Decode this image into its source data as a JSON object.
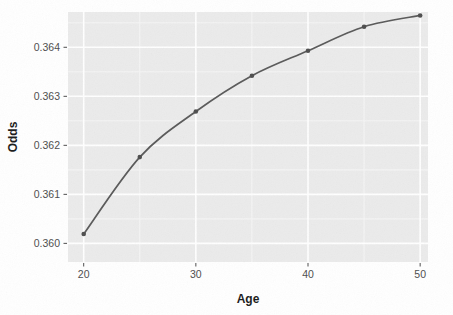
{
  "chart_data": {
    "type": "line",
    "title": "",
    "subtitle": "",
    "xlabel": "Age",
    "ylabel": "Odds",
    "x": [
      20,
      25,
      30,
      35,
      40,
      45,
      50
    ],
    "values": [
      0.36019,
      0.36176,
      0.36269,
      0.36342,
      0.36393,
      0.36442,
      0.36465
    ],
    "series": [
      {
        "name": "Odds",
        "x": [
          20,
          25,
          30,
          35,
          40,
          45,
          50
        ],
        "values": [
          0.36019,
          0.36176,
          0.36269,
          0.36342,
          0.36393,
          0.36442,
          0.36465
        ]
      }
    ],
    "xlim": [
      18.6,
      50.7
    ],
    "ylim": [
      0.35962,
      0.36472
    ],
    "x_ticks": [
      20,
      30,
      40,
      50
    ],
    "x_tick_labels": [
      "20",
      "30",
      "40",
      "50"
    ],
    "y_ticks": [
      0.36,
      0.361,
      0.362,
      0.363,
      0.364
    ],
    "y_tick_labels": [
      "0.360",
      "0.361",
      "0.362",
      "0.363",
      "0.364"
    ],
    "grid": true,
    "grid_major": true,
    "grid_minor": true,
    "legend": false,
    "legend_position": "none",
    "marker": "circle",
    "line_color": "#595959",
    "point_color": "#4d4d4d",
    "panel_background": "#ebebeb",
    "grid_color": "#ffffff",
    "annotations": []
  },
  "axes": {
    "x": {
      "title": "Age",
      "ticks": [
        {
          "label": "20",
          "value": 20
        },
        {
          "label": "30",
          "value": 30
        },
        {
          "label": "40",
          "value": 40
        },
        {
          "label": "50",
          "value": 50
        }
      ]
    },
    "y": {
      "title": "Odds",
      "ticks": [
        {
          "label": "0.364",
          "value": 0.364
        },
        {
          "label": "0.363",
          "value": 0.363
        },
        {
          "label": "0.362",
          "value": 0.362
        },
        {
          "label": "0.361",
          "value": 0.361
        },
        {
          "label": "0.360",
          "value": 0.36
        }
      ]
    }
  },
  "colors": {
    "panel": "#ebebeb",
    "grid_major": "#ffffff",
    "grid_minor": "#f5f5f5",
    "line": "#595959",
    "point": "#4d4d4d",
    "text": "#4d4d4d",
    "title_text": "#1a1a1a",
    "page": "#ffffff"
  }
}
